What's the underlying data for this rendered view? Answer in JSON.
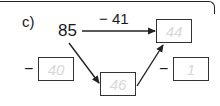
{
  "part_label": "c)",
  "start_value": "85",
  "operations": {
    "top": "− 41",
    "left": "−",
    "right": "−"
  },
  "boxes": {
    "result_top": "44",
    "left_operand": "40",
    "middle": "46",
    "right_operand": "1"
  },
  "colors": {
    "line": "#222222",
    "answer_text": "#d8d8d8"
  }
}
